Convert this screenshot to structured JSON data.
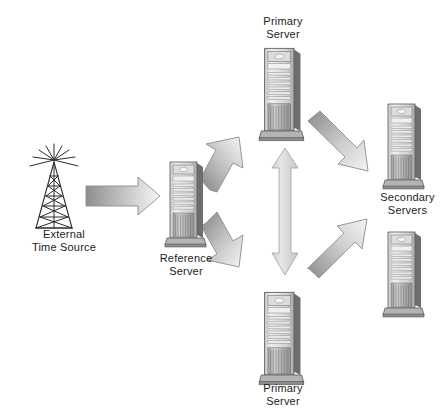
{
  "diagram": {
    "background_color": "#ffffff",
    "text_color": "#1c1c1c",
    "nodes": [
      {
        "id": "external-time-source",
        "icon": "antenna-tower-icon",
        "label": "External\nTime Source",
        "x": 20,
        "y": 142,
        "label_x": 14,
        "label_y": 228
      },
      {
        "id": "reference-server",
        "icon": "server-tower-icon",
        "label": "Reference\nServer",
        "x": 164,
        "y": 158,
        "label_x": 148,
        "label_y": 252
      },
      {
        "id": "primary-server-top",
        "icon": "server-tower-icon",
        "label": "Primary\nServer",
        "x": 258,
        "y": 44,
        "label_x": 245,
        "label_y": 15
      },
      {
        "id": "primary-server-bottom",
        "icon": "server-tower-icon",
        "label": "Primary\nServer",
        "x": 258,
        "y": 288,
        "label_x": 245,
        "label_y": 382
      },
      {
        "id": "secondary-server-upper",
        "icon": "server-tower-icon",
        "label": "Secondary\nServers",
        "x": 382,
        "y": 100,
        "label_x": 368,
        "label_y": 191
      },
      {
        "id": "secondary-server-lower",
        "icon": "server-tower-icon",
        "label": "",
        "x": 382,
        "y": 228,
        "label_x": 0,
        "label_y": 0
      }
    ],
    "connectors": [
      {
        "id": "source-to-reference",
        "from": "external-time-source",
        "to": "reference-server",
        "heads": "single",
        "direction": "right",
        "shade_from": "#9a9a9a",
        "shade_to": "#f2f2f2"
      },
      {
        "id": "reference-to-primary-top",
        "from": "reference-server",
        "to": "primary-server-top",
        "heads": "double",
        "direction": "up-right",
        "shade_from": "#8f8f8f",
        "shade_to": "#f4f4f4"
      },
      {
        "id": "reference-to-primary-bottom",
        "from": "reference-server",
        "to": "primary-server-bottom",
        "heads": "double",
        "direction": "down-right",
        "shade_from": "#8f8f8f",
        "shade_to": "#f4f4f4"
      },
      {
        "id": "primary-top-to-primary-bottom",
        "from": "primary-server-top",
        "to": "primary-server-bottom",
        "heads": "double",
        "direction": "vertical",
        "shade_from": "#d2d2d2",
        "shade_to": "#efefef"
      },
      {
        "id": "primary-top-to-secondary-upper",
        "from": "primary-server-top",
        "to": "secondary-server-upper",
        "heads": "single",
        "direction": "down-right",
        "shade_from": "#8d8d8d",
        "shade_to": "#f2f2f2"
      },
      {
        "id": "primary-bottom-to-secondary-lower",
        "from": "primary-server-bottom",
        "to": "secondary-server-lower",
        "heads": "single",
        "direction": "up-right",
        "shade_from": "#8d8d8d",
        "shade_to": "#f2f2f2"
      }
    ]
  }
}
